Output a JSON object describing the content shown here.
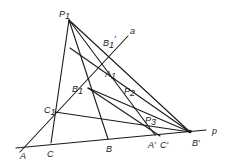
{
  "diagram": {
    "colors": {
      "stroke": "#1a1a1a",
      "text": "#222222",
      "background": "#ffffff"
    },
    "labels": {
      "P1": "P",
      "P1_sub": "1",
      "B1p": "B",
      "B1p_sub": "1",
      "B1p_prime": "′",
      "a": "a",
      "A1": "A",
      "A1_sub": "1",
      "B1": "B",
      "B1_sub": "1",
      "P2": "P",
      "P2_sub": "2",
      "C1": "C",
      "C1_sub": "1",
      "P3": "P",
      "P3_sub": "3",
      "A": "A",
      "C": "C",
      "B": "B",
      "Ap": "A′",
      "Cp": "C′",
      "Bp": "B′",
      "p": "p"
    },
    "lines": [
      {
        "name": "line-p",
        "from": "A",
        "to": "p-end"
      },
      {
        "name": "line-a",
        "from": "A",
        "to": "a-end"
      },
      {
        "name": "P1-C",
        "from": "P1",
        "to": "C"
      },
      {
        "name": "P1-B",
        "from": "P1",
        "to": "B"
      },
      {
        "name": "P1-Aprime",
        "from": "P1",
        "to": "A'"
      },
      {
        "name": "P1-Bprime",
        "from": "P1",
        "to": "B'"
      },
      {
        "name": "B1-Bprime",
        "from": "B1",
        "to": "B'"
      },
      {
        "name": "C1-Bprime",
        "from": "C1",
        "to": "B'"
      },
      {
        "name": "A1-Bprime",
        "from": "A1",
        "to": "B'"
      }
    ]
  }
}
